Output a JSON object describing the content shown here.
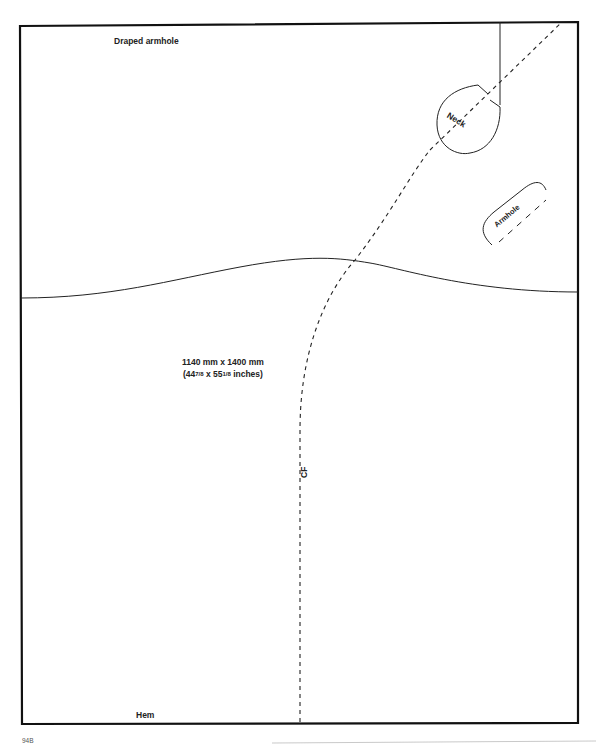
{
  "diagram": {
    "title": "Draped armhole",
    "dimensions": {
      "metric": "1140 mm x 1400 mm",
      "imperial_prefix": "(44",
      "imperial_frac1": "7/8",
      "imperial_mid": " x 55",
      "imperial_frac2": "1/8",
      "imperial_suffix": " inches)"
    },
    "labels": {
      "neck": "Neck",
      "armhole": "Armhole",
      "center_front": "CF",
      "hem": "Hem"
    },
    "page_number": "94B",
    "colors": {
      "line": "#1a1a1a",
      "border": "#111111",
      "background": "#ffffff"
    }
  }
}
